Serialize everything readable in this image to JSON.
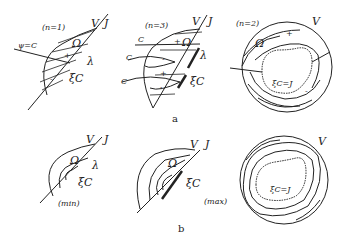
{
  "rows": [
    {
      "caption": "a",
      "panels": [
        {
          "id": "a1",
          "case": "(n=1)",
          "labels": {
            "V": "V",
            "J": "J",
            "omega": "Ω",
            "lambda": "λ",
            "xi": "ξC",
            "psi": "ψ=C",
            "plus": "+",
            "minus": "-"
          }
        },
        {
          "id": "a2",
          "case": "(n=3)",
          "labels": {
            "V": "V",
            "J": "J",
            "omega": "Ω",
            "lambda": "λ",
            "xi": "ξC",
            "c1": "C",
            "c2": "C",
            "c3": "C",
            "plus1": "+",
            "minus1": "-",
            "plus2": "+",
            "minus2": "-"
          }
        },
        {
          "id": "a3",
          "case": "(n=2)",
          "labels": {
            "V": "V",
            "omega": "Ω",
            "xi": "ξC=J",
            "plus": "+",
            "minus": "-"
          }
        }
      ]
    },
    {
      "caption": "b",
      "panels": [
        {
          "id": "b1",
          "case": "(min)",
          "labels": {
            "V": "V",
            "J": "J",
            "omega": "Ω",
            "lambda": "λ",
            "xi": "ξC"
          }
        },
        {
          "id": "b2",
          "case": "(max)",
          "labels": {
            "V": "V",
            "J": "J",
            "omega": "Ω",
            "xi": "ξC"
          }
        },
        {
          "id": "b3",
          "case": "",
          "labels": {
            "V": "V",
            "xi": "ξC=J"
          }
        }
      ]
    }
  ]
}
